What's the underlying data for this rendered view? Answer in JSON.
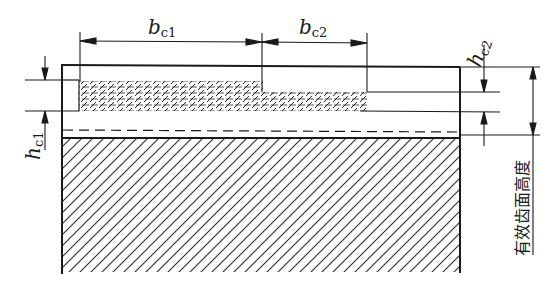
{
  "diagram": {
    "type": "engineering cross-section",
    "labels": {
      "b_c1": {
        "base": "b",
        "sub": "c1"
      },
      "b_c2": {
        "base": "b",
        "sub": "c2"
      },
      "h_c1": {
        "base": "h",
        "sub": "c1"
      },
      "h_c2": {
        "base": "h",
        "sub": "c2"
      },
      "effective_height": "有效齿面高度"
    },
    "colors": {
      "line": "#1a1a1a",
      "background": "#ffffff"
    }
  }
}
